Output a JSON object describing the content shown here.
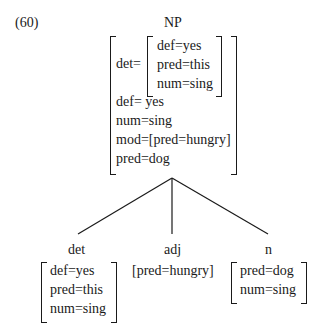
{
  "example_number": "(60)",
  "root": {
    "label": "NP",
    "features": {
      "det_key": "det=",
      "det_inner": [
        "def=yes",
        "pred=this",
        "num=sing"
      ],
      "rest": [
        "def= yes",
        "num=sing",
        "mod=[pred=hungry]",
        "pred=dog"
      ]
    }
  },
  "children": [
    {
      "label": "det",
      "features": [
        "def=yes",
        "pred=this",
        "num=sing"
      ]
    },
    {
      "label": "adj",
      "features": [
        "[pred=hungry]"
      ]
    },
    {
      "label": "n",
      "features": [
        "pred=dog",
        "num=sing"
      ]
    }
  ]
}
